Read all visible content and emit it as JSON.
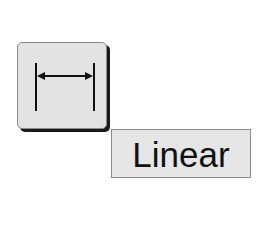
{
  "tool_button": {
    "icon": "linear-dimension-icon",
    "pressed": false
  },
  "tooltip": {
    "label": "Linear"
  },
  "colors": {
    "button_fill": "#e3e3e3",
    "button_shadow": "#1a1a1a",
    "tooltip_fill": "#e6e6e6",
    "tooltip_border": "#8c8c8c",
    "text": "#111111"
  }
}
